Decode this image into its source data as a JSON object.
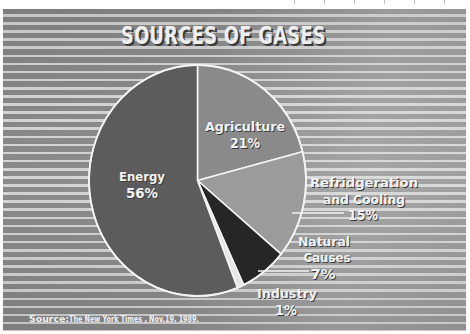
{
  "chart_data": {
    "type": "pie",
    "title": "SOURCES OF GASES",
    "categories": [
      "Agriculture",
      "Refridgeration and Cooling",
      "Natural Causes",
      "Industry",
      "Energy"
    ],
    "values": [
      21,
      15,
      7,
      1,
      56
    ],
    "unit": "%",
    "start_angle_deg": 0,
    "direction": "clockwise",
    "colors": [
      "#8a8a8a",
      "#9b9b9b",
      "#262626",
      "#e6e6e6",
      "#5c5c5c"
    ],
    "slices": [
      {
        "label": "Agriculture",
        "value": 21,
        "value_label": "21%",
        "color": "#8a8a8a"
      },
      {
        "label": "Refridgeration and Cooling",
        "value": 15,
        "value_label": "15%",
        "color": "#9b9b9b"
      },
      {
        "label": "Natural Causes",
        "value": 7,
        "value_label": "7%",
        "color": "#262626"
      },
      {
        "label": "Industry",
        "value": 1,
        "value_label": "1%",
        "color": "#e6e6e6"
      },
      {
        "label": "Energy",
        "value": 56,
        "value_label": "56%",
        "color": "#5c5c5c"
      }
    ],
    "source": "Source:  The New York Times , Nov.19, 1989.",
    "legend": "none (direct labels)"
  },
  "title": "SOURCES OF GASES",
  "labels": {
    "agriculture": {
      "line1": "Agriculture",
      "pct": "21%"
    },
    "refrigeration": {
      "line1": "Refridgeration",
      "line2": "and Cooling",
      "pct": "15%"
    },
    "natural": {
      "line1": "Natural",
      "line2": "Causes",
      "pct": "7%"
    },
    "industry": {
      "line1": "Industry",
      "pct": "1%"
    },
    "energy": {
      "line1": "Energy",
      "pct": "56%"
    }
  },
  "source": {
    "prefix": "Source:",
    "text": "The New York Times , Nov.19, 1989."
  },
  "colors": {
    "stripe_dark": "#8a8a8a",
    "stripe_light": "#e0e0e0",
    "slice_outline": "#f4f4f4"
  }
}
